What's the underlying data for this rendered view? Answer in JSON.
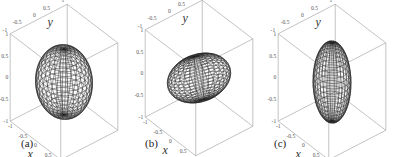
{
  "chart_data": [
    {
      "type": "surface3d",
      "panel_label": "(a)",
      "shape": "sphere",
      "semi_axes": {
        "a": 0.75,
        "b": 0.75,
        "c": 0.75
      },
      "xlabel": "x",
      "ylabel": "y",
      "zlabel": "z",
      "xticks": [
        "-1",
        "-0.5",
        "0",
        "0.5",
        "1"
      ],
      "yticks": [
        "-1",
        "-0.5",
        "0",
        "0.5",
        "1"
      ],
      "zticks": [
        "-1",
        "-0.5",
        "0",
        "0.5",
        "1"
      ],
      "xlim": [
        -1,
        1
      ],
      "ylim": [
        -1,
        1
      ],
      "zlim": [
        -1,
        1
      ],
      "style": "wireframe mesh, bounding box"
    },
    {
      "type": "surface3d",
      "panel_label": "(b)",
      "shape": "oblate ellipsoid (tilted)",
      "semi_axes": {
        "a": 0.85,
        "b": 0.85,
        "c": 0.45
      },
      "xlabel": "x",
      "ylabel": "y",
      "zlabel": "z",
      "xticks": [
        "-1",
        "-0.5",
        "0",
        "0.5",
        "1"
      ],
      "yticks": [
        "-1",
        "-0.5",
        "0",
        "0.5",
        "1"
      ],
      "zticks": [
        "-1",
        "-0.5",
        "0",
        "0.5",
        "1"
      ],
      "xlim": [
        -1,
        1
      ],
      "ylim": [
        -1,
        1
      ],
      "zlim": [
        -1,
        1
      ],
      "style": "wireframe mesh, bounding box"
    },
    {
      "type": "surface3d",
      "panel_label": "(c)",
      "shape": "prolate ellipsoid",
      "semi_axes": {
        "a": 0.5,
        "b": 0.5,
        "c": 0.9
      },
      "xlabel": "x",
      "ylabel": "y",
      "zlabel": "z",
      "xticks": [
        "-1",
        "-0.5",
        "0",
        "0.5",
        "1"
      ],
      "yticks": [
        "-1",
        "-0.5",
        "0",
        "0.5",
        "1"
      ],
      "zticks": [
        "-1",
        "-0.5",
        "0",
        "0.5",
        "1"
      ],
      "xlim": [
        -1,
        1
      ],
      "ylim": [
        -1,
        1
      ],
      "zlim": [
        -1,
        1
      ],
      "style": "wireframe mesh, bounding box"
    }
  ],
  "panels": [
    {
      "label": "(a)",
      "x": "x",
      "y": "y",
      "z": "z",
      "ticks": {
        "y": [
          "-1",
          "-0.5",
          "0",
          "0.5",
          "1"
        ],
        "z": [
          "1",
          "0.5",
          "0",
          "-0.5",
          "-1"
        ],
        "x": [
          "-1",
          "-0.5",
          "0",
          "0.5",
          "1"
        ]
      }
    },
    {
      "label": "(b)",
      "x": "x",
      "y": "y",
      "z": "z",
      "ticks": {
        "y": [
          "-1",
          "-0.5",
          "0",
          "0.5",
          "1"
        ],
        "z": [
          "1",
          "0.5",
          "0",
          "-0.5",
          "-1"
        ],
        "x": [
          "-1",
          "-0.5",
          "0",
          "0.5",
          "1"
        ]
      }
    },
    {
      "label": "(c)",
      "x": "x",
      "y": "y",
      "z": "z",
      "ticks": {
        "y": [
          "-1",
          "-0.5",
          "0",
          "0.5",
          "1"
        ],
        "z": [
          "1",
          "0.5",
          "0",
          "-0.5",
          "-1"
        ],
        "x": [
          "-1",
          "-0.5",
          "0",
          "0.5",
          "1"
        ]
      }
    }
  ],
  "colors": {
    "mesh": "#222222",
    "box": "#9a9a9a",
    "background": "#ffffff"
  }
}
